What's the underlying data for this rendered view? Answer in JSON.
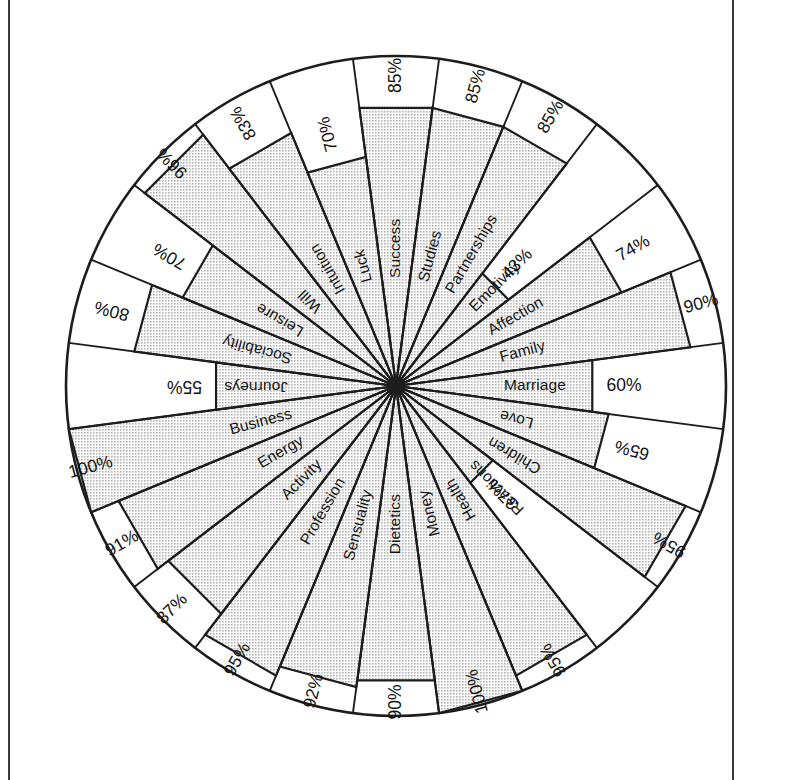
{
  "chart_data": {
    "type": "pie",
    "title": "",
    "subtitle": "",
    "xlabel": "",
    "ylabel": "",
    "unit": "%",
    "axis_max": 100,
    "grid": false,
    "legend": "none",
    "sector_count": 24,
    "categories": [
      "Success",
      "Studies",
      "Partnerships",
      "Emotivity",
      "Affection",
      "Family",
      "Marriage",
      "Love",
      "Children",
      "Reactions",
      "Health",
      "Money",
      "Dietetics",
      "Sensuality",
      "Profession",
      "Activity",
      "Energy",
      "Business",
      "Journeys",
      "Sociability",
      "Leisure",
      "Will",
      "Intuition",
      "Luck"
    ],
    "values": [
      85,
      85,
      85,
      43,
      74,
      90,
      60,
      65,
      95,
      37,
      95,
      100,
      90,
      92,
      95,
      87,
      91,
      100,
      55,
      80,
      70,
      96,
      83,
      70
    ],
    "value_labels": [
      "85%",
      "85%",
      "85%",
      "43%",
      "74%",
      "90%",
      "60%",
      "65%",
      "95%",
      "37%",
      "95%",
      "100%",
      "90%",
      "92%",
      "95%",
      "87%",
      "91%",
      "100%",
      "55%",
      "80%",
      "70%",
      "96%",
      "83%",
      "70%"
    ]
  },
  "figure": {
    "outline_color": "#1d1d1d",
    "fill_color": "#c9c9c9",
    "background_color": "#ffffff",
    "frame_color": "#3a3a3a"
  }
}
